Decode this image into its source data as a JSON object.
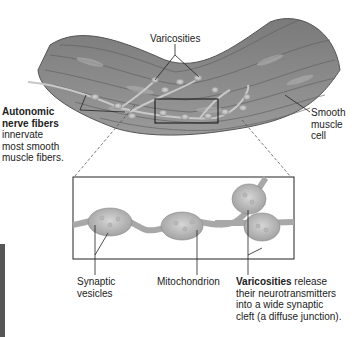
{
  "figure": {
    "labels": {
      "varicosities_top": "Varicosities",
      "autonomic_bold_1": "Autonomic",
      "autonomic_bold_2": "nerve fibers",
      "autonomic_desc_1": "innervate",
      "autonomic_desc_2": "most smooth",
      "autonomic_desc_3": "muscle fibers.",
      "smooth_1": "Smooth",
      "smooth_2": "muscle",
      "smooth_3": "cell",
      "synaptic_1": "Synaptic",
      "synaptic_2": "vesicles",
      "mitochondrion": "Mitochondrion",
      "varicosities_bold": "Varicosities",
      "varicosities_desc_1": " release",
      "varicosities_desc_2": "their neurotransmitters",
      "varicosities_desc_3": "into a wide synaptic",
      "varicosities_desc_4": "cleft (a diffuse junction)."
    },
    "colors": {
      "tissue": "#8a8a8a",
      "tissue_dark": "#5e5e5e",
      "fiber": "#c8c8c8",
      "leader": "#222222"
    }
  }
}
